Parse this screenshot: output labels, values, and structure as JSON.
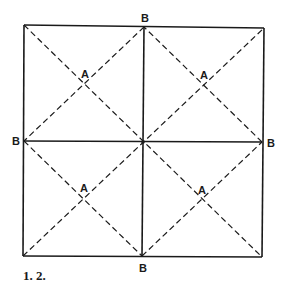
{
  "diagram": {
    "type": "folding-crease-pattern",
    "square": {
      "x1": 24,
      "y1": 26,
      "x2": 263,
      "y2": 257
    },
    "center": {
      "x": 143,
      "y": 142
    },
    "solid_lines": [
      {
        "from": "top-left",
        "to": "top-right",
        "desc": "top edge"
      },
      {
        "from": "top-right",
        "to": "bottom-right",
        "desc": "right edge"
      },
      {
        "from": "bottom-right",
        "to": "bottom-left",
        "desc": "bottom edge"
      },
      {
        "from": "bottom-left",
        "to": "top-left",
        "desc": "left edge"
      },
      {
        "from": "top-B",
        "to": "bottom-B",
        "desc": "vertical center crease"
      },
      {
        "from": "left-B",
        "to": "right-B",
        "desc": "horizontal center crease"
      }
    ],
    "dashed_lines": [
      {
        "from": "top-left",
        "to": "bottom-right",
        "desc": "main diagonal"
      },
      {
        "from": "bottom-left",
        "to": "top-right",
        "desc": "anti diagonal"
      },
      {
        "from": "top-B",
        "to": "left-B"
      },
      {
        "from": "left-B",
        "to": "bottom-B"
      },
      {
        "from": "bottom-B",
        "to": "right-B"
      },
      {
        "from": "right-B",
        "to": "top-B"
      }
    ],
    "labels": {
      "b_top": "B",
      "b_bottom": "B",
      "b_left": "B",
      "b_right": "B",
      "a_top_left": "A",
      "a_top_right": "A",
      "a_bottom_left": "A",
      "a_bottom_right": "A"
    },
    "colors": {
      "ink": "#1a1a1a",
      "background": "#ffffff"
    }
  },
  "caption": "1.  2."
}
